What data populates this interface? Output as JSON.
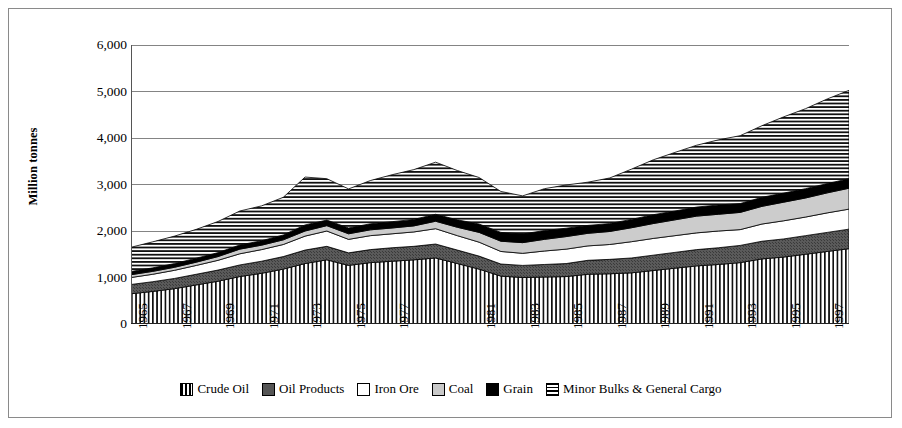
{
  "chart_data": {
    "type": "area",
    "stacked": true,
    "title": "",
    "xlabel": "",
    "ylabel": "Million tonnes",
    "ylim": [
      0,
      6000
    ],
    "ytick_labels": [
      "0",
      "1,000",
      "2,000",
      "3,000",
      "4,000",
      "5,000",
      "6,000"
    ],
    "yticks": [
      0,
      1000,
      2000,
      3000,
      4000,
      5000,
      6000
    ],
    "grid": "horizontal",
    "legend_position": "bottom",
    "x": [
      1965,
      1966,
      1967,
      1968,
      1969,
      1970,
      1971,
      1972,
      1973,
      1974,
      1975,
      1976,
      1977,
      1978,
      1979,
      1980,
      1981,
      1982,
      1983,
      1984,
      1985,
      1986,
      1987,
      1988,
      1989,
      1990,
      1991,
      1992,
      1993,
      1994,
      1995,
      1996,
      1997,
      1998
    ],
    "xtick_labels": [
      "1965",
      "1967",
      "1969",
      "1971",
      "1973",
      "1975",
      "1977",
      "1981",
      "1983",
      "1985",
      "1987",
      "1989",
      "1991",
      "1993",
      "1995",
      "1997"
    ],
    "xtick_years": [
      1965,
      1967,
      1969,
      1971,
      1973,
      1975,
      1977,
      1981,
      1983,
      1985,
      1987,
      1989,
      1991,
      1993,
      1995,
      1997
    ],
    "series": [
      {
        "name": "Crude Oil",
        "pattern": "vertical-stripes",
        "color": "#000000",
        "values": [
          650,
          700,
          760,
          840,
          920,
          1020,
          1090,
          1180,
          1300,
          1380,
          1260,
          1320,
          1350,
          1380,
          1420,
          1300,
          1180,
          1030,
          1000,
          1010,
          1020,
          1070,
          1080,
          1100,
          1150,
          1200,
          1250,
          1280,
          1320,
          1400,
          1440,
          1500,
          1560,
          1620
        ]
      },
      {
        "name": "Oil Products",
        "pattern": "dark-speckle",
        "color": "#555555",
        "values": [
          200,
          210,
          220,
          230,
          240,
          250,
          260,
          270,
          290,
          290,
          270,
          280,
          290,
          290,
          300,
          290,
          280,
          260,
          260,
          270,
          280,
          300,
          310,
          320,
          330,
          340,
          350,
          360,
          370,
          380,
          390,
          400,
          410,
          420
        ]
      },
      {
        "name": "Iron Ore",
        "pattern": "solid-white",
        "color": "#ffffff",
        "values": [
          150,
          160,
          175,
          190,
          210,
          240,
          250,
          260,
          300,
          330,
          290,
          300,
          300,
          310,
          330,
          310,
          300,
          270,
          260,
          290,
          310,
          310,
          320,
          350,
          360,
          360,
          360,
          360,
          340,
          370,
          390,
          400,
          420,
          430
        ]
      },
      {
        "name": "Coal",
        "pattern": "light-gray",
        "color": "#c9c9c9",
        "values": [
          60,
          62,
          65,
          70,
          80,
          100,
          95,
          100,
          110,
          115,
          120,
          125,
          125,
          130,
          160,
          180,
          210,
          220,
          230,
          250,
          270,
          270,
          280,
          300,
          320,
          340,
          360,
          360,
          370,
          380,
          400,
          410,
          430,
          450
        ]
      },
      {
        "name": "Grain",
        "pattern": "solid-black",
        "color": "#000000",
        "values": [
          70,
          75,
          80,
          85,
          85,
          90,
          95,
          105,
          130,
          120,
          125,
          130,
          135,
          140,
          150,
          160,
          180,
          190,
          185,
          190,
          180,
          170,
          170,
          180,
          190,
          190,
          195,
          200,
          190,
          195,
          195,
          200,
          200,
          205
        ]
      },
      {
        "name": "Minor Bulks & General Cargo",
        "pattern": "horizontal-stripes",
        "color": "#000000",
        "values": [
          520,
          560,
          590,
          620,
          670,
          730,
          750,
          810,
          1030,
          890,
          840,
          930,
          1010,
          1070,
          1120,
          1060,
          1000,
          880,
          820,
          900,
          930,
          930,
          980,
          1080,
          1180,
          1260,
          1330,
          1400,
          1460,
          1540,
          1640,
          1720,
          1820,
          1900
        ]
      }
    ]
  },
  "legend": {
    "items": [
      {
        "label": "Crude Oil",
        "swatch": "crude-oil-swatch"
      },
      {
        "label": "Oil Products",
        "swatch": "oil-products-swatch"
      },
      {
        "label": "Iron Ore",
        "swatch": "iron-ore-swatch"
      },
      {
        "label": "Coal",
        "swatch": "coal-swatch"
      },
      {
        "label": "Grain",
        "swatch": "grain-swatch"
      },
      {
        "label": "Minor Bulks & General Cargo",
        "swatch": "minor-bulks-swatch"
      }
    ]
  }
}
